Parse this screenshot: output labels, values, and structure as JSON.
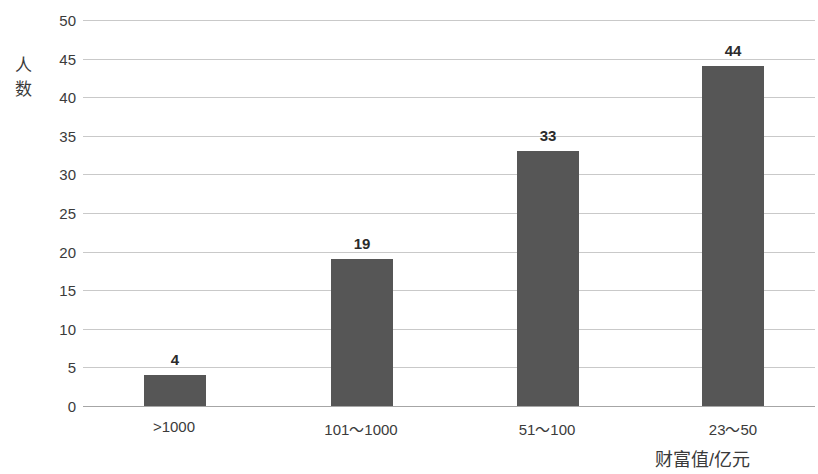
{
  "chart_data": {
    "type": "bar",
    "title": "",
    "subtitle": "",
    "categories": [
      ">1000",
      "101～1000",
      "51～100",
      "23～50"
    ],
    "values": [
      4,
      19,
      33,
      44
    ],
    "series": [
      {
        "name": "人数",
        "values": [
          4,
          19,
          33,
          44
        ]
      }
    ],
    "xlabel": "财富值/亿元",
    "ylabel": "人数",
    "ylim": [
      0,
      50
    ],
    "ytick_step": 5,
    "yticks": [
      50,
      45,
      40,
      35,
      30,
      25,
      20,
      15,
      10,
      5,
      0
    ],
    "ytick_labels": [
      "50",
      "45",
      "40",
      "35",
      "30",
      "25",
      "20",
      "15",
      "10",
      "5",
      "0"
    ],
    "data_labels": [
      "4",
      "19",
      "33",
      "44"
    ],
    "grid": true,
    "grid_axis": "y",
    "legend": false,
    "legend_position": "none",
    "colors": {
      "bar": "#565656",
      "gridline": "#c9c9c9",
      "baseline": "#a6a6a6",
      "text": "#3b3b3b",
      "data_label": "#2b2b2b",
      "background": "#ffffff"
    }
  },
  "axis": {
    "y_title_chars": [
      "人",
      "数"
    ],
    "x_title": "财富值/亿元"
  }
}
